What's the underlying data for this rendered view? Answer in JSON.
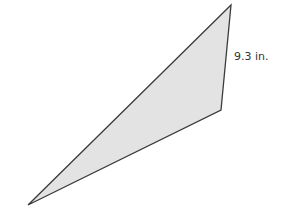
{
  "diagram": {
    "shape": "triangle",
    "fill_color": "#e3e3e3",
    "stroke_color": "#3a3a3a",
    "vertices": [
      [
        231,
        5
      ],
      [
        221,
        110
      ],
      [
        28,
        205
      ]
    ],
    "side_label": "9.3 in."
  }
}
